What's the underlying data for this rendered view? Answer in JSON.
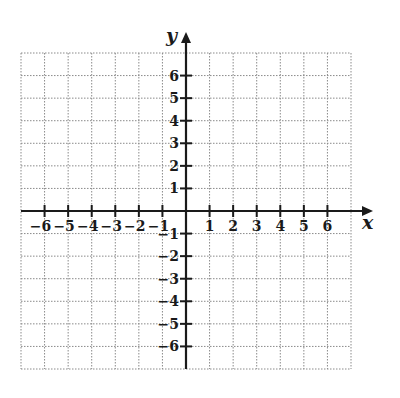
{
  "diagram": {
    "type": "coordinate-plane",
    "x_axis": {
      "label": "x",
      "min": -7,
      "max": 7,
      "tick_labels": [
        "-6",
        "-5",
        "-4",
        "-3",
        "-2",
        "-1",
        "1",
        "2",
        "3",
        "4",
        "5",
        "6"
      ]
    },
    "y_axis": {
      "label": "y",
      "min": -7,
      "max": 7,
      "tick_labels": [
        "6",
        "5",
        "4",
        "3",
        "2",
        "1",
        "-1",
        "-2",
        "-3",
        "-4",
        "-5",
        "-6"
      ]
    },
    "grid": {
      "style": "dotted",
      "columns": 14,
      "rows": 14
    },
    "colors": {
      "axis": "#1a1a1a",
      "grid": "#8a8a8a",
      "background": "#ffffff"
    }
  }
}
